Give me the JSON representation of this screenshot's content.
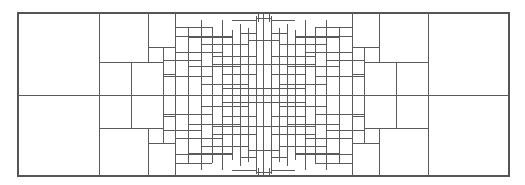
{
  "diagram": {
    "kind": "rectangle-tiling",
    "symmetry": [
      "horizontal",
      "vertical"
    ],
    "colors": {
      "background": "#ffffff",
      "line": "#5a5a5a"
    },
    "labels": []
  }
}
